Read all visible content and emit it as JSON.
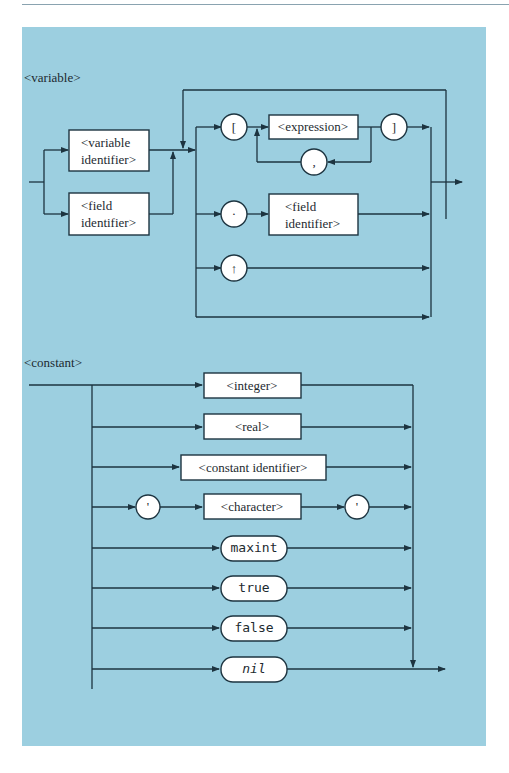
{
  "variable": {
    "title": "<variable>",
    "variable_identifier": [
      "<variable",
      "identifier>"
    ],
    "field_identifier": [
      "<field",
      "identifier>"
    ],
    "open_bracket": "[",
    "expression": "<expression>",
    "comma": ",",
    "close_bracket": "]",
    "dot": "·",
    "field_identifier_2": [
      "<field",
      "identifier>"
    ],
    "pointer": "↑"
  },
  "constant": {
    "title": "<constant>",
    "integer": "<integer>",
    "real": "<real>",
    "constant_identifier": "<constant identifier>",
    "quote_open": "'",
    "character": "<character>",
    "quote_close": "'",
    "maxint": "maxint",
    "true": "true",
    "false": "false",
    "nil": "nil"
  },
  "colors": {
    "panel": "#9ccfe0",
    "line": "#1d3440",
    "box_fill": "#ffffff"
  }
}
